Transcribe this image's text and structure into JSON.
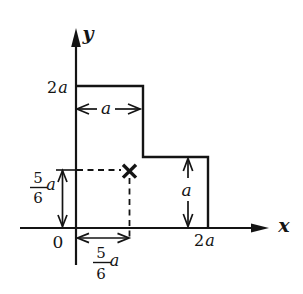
{
  "figure": {
    "background": "#ffffff",
    "ink": "#141414",
    "axes": {
      "x_label": "x",
      "y_label": "y",
      "origin_label": "0",
      "x_tick": {
        "coef": "2",
        "var": "a"
      },
      "y_tick": {
        "coef": "2",
        "var": "a"
      }
    },
    "dims": {
      "top_width": "a",
      "right_height": "a",
      "centroid_x": {
        "num": "5",
        "den": "6",
        "var": "a"
      },
      "centroid_y": {
        "num": "5",
        "den": "6",
        "var": "a"
      }
    },
    "shape": {
      "name": "stepped-plate",
      "vertices_units_of_a": [
        [
          0,
          0
        ],
        [
          2,
          0
        ],
        [
          2,
          1
        ],
        [
          1,
          1
        ],
        [
          1,
          2
        ],
        [
          0,
          2
        ]
      ],
      "centroid_units_of_a": [
        0.8333,
        0.8333
      ],
      "marker": "x-cross"
    }
  }
}
